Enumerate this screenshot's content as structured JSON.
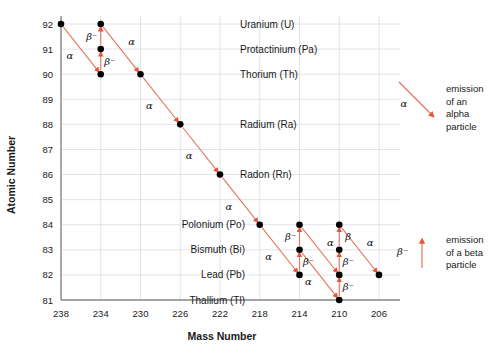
{
  "chart_data": {
    "type": "scatter",
    "title": "",
    "xlabel": "Mass Number",
    "ylabel": "Atomic Number",
    "xticks": [
      238,
      234,
      230,
      226,
      222,
      218,
      214,
      210,
      206
    ],
    "yticks": [
      81,
      82,
      83,
      84,
      85,
      86,
      87,
      88,
      89,
      90,
      91,
      92
    ],
    "xlim": [
      238,
      206
    ],
    "ylim": [
      81,
      92
    ],
    "grid": true,
    "legend_position": "right",
    "accent_color": "#e8553a",
    "nodes": [
      {
        "mass": 238,
        "z": 92,
        "element": "U"
      },
      {
        "mass": 234,
        "z": 90,
        "element": "Th"
      },
      {
        "mass": 234,
        "z": 91,
        "element": "Pa"
      },
      {
        "mass": 234,
        "z": 92,
        "element": "U"
      },
      {
        "mass": 230,
        "z": 90,
        "element": "Th"
      },
      {
        "mass": 226,
        "z": 88,
        "element": "Ra"
      },
      {
        "mass": 222,
        "z": 86,
        "element": "Rn"
      },
      {
        "mass": 218,
        "z": 84,
        "element": "Po"
      },
      {
        "mass": 214,
        "z": 82,
        "element": "Pb"
      },
      {
        "mass": 214,
        "z": 83,
        "element": "Bi"
      },
      {
        "mass": 214,
        "z": 84,
        "element": "Po"
      },
      {
        "mass": 210,
        "z": 81,
        "element": "Tl"
      },
      {
        "mass": 210,
        "z": 82,
        "element": "Pb"
      },
      {
        "mass": 210,
        "z": 83,
        "element": "Bi"
      },
      {
        "mass": 210,
        "z": 84,
        "element": "Po"
      },
      {
        "mass": 206,
        "z": 82,
        "element": "Pb"
      }
    ],
    "decays": [
      {
        "from": [
          238,
          92
        ],
        "to": [
          234,
          90
        ],
        "type": "alpha",
        "label": "α",
        "label_pos": "left"
      },
      {
        "from": [
          234,
          90
        ],
        "to": [
          234,
          91
        ],
        "type": "beta",
        "label": "β⁻",
        "label_pos": "right"
      },
      {
        "from": [
          234,
          91
        ],
        "to": [
          234,
          92
        ],
        "type": "beta",
        "label": "β⁻",
        "label_pos": "left"
      },
      {
        "from": [
          234,
          92
        ],
        "to": [
          230,
          90
        ],
        "type": "alpha",
        "label": "α",
        "label_pos": "right"
      },
      {
        "from": [
          230,
          90
        ],
        "to": [
          226,
          88
        ],
        "type": "alpha",
        "label": "α",
        "label_pos": "left"
      },
      {
        "from": [
          226,
          88
        ],
        "to": [
          222,
          86
        ],
        "type": "alpha",
        "label": "α",
        "label_pos": "left"
      },
      {
        "from": [
          222,
          86
        ],
        "to": [
          218,
          84
        ],
        "type": "alpha",
        "label": "α",
        "label_pos": "left"
      },
      {
        "from": [
          218,
          84
        ],
        "to": [
          214,
          82
        ],
        "type": "alpha",
        "label": "α",
        "label_pos": "left"
      },
      {
        "from": [
          214,
          82
        ],
        "to": [
          214,
          83
        ],
        "type": "beta",
        "label": "β⁻",
        "label_pos": "right"
      },
      {
        "from": [
          214,
          83
        ],
        "to": [
          214,
          84
        ],
        "type": "beta",
        "label": "β⁻",
        "label_pos": "left"
      },
      {
        "from": [
          214,
          84
        ],
        "to": [
          210,
          82
        ],
        "type": "alpha",
        "label": "α",
        "label_pos": "right"
      },
      {
        "from": [
          214,
          83
        ],
        "to": [
          210,
          81
        ],
        "type": "alpha",
        "label": "α",
        "label_pos": "left"
      },
      {
        "from": [
          210,
          81
        ],
        "to": [
          210,
          82
        ],
        "type": "beta",
        "label": "β⁻",
        "label_pos": "right"
      },
      {
        "from": [
          210,
          82
        ],
        "to": [
          210,
          83
        ],
        "type": "beta",
        "label": "β⁻",
        "label_pos": "right"
      },
      {
        "from": [
          210,
          83
        ],
        "to": [
          210,
          84
        ],
        "type": "beta",
        "label": "β",
        "label_pos": "right"
      },
      {
        "from": [
          210,
          84
        ],
        "to": [
          206,
          82
        ],
        "type": "alpha",
        "label": "α",
        "label_pos": "right"
      }
    ],
    "element_labels": [
      {
        "z": 92,
        "text": "Uranium (U)"
      },
      {
        "z": 91,
        "text": "Protactinium (Pa)"
      },
      {
        "z": 90,
        "text": "Thorium (Th)"
      },
      {
        "z": 88,
        "text": "Radium (Ra)"
      },
      {
        "z": 86,
        "text": "Radon (Rn)"
      },
      {
        "z": 84,
        "text": "Polonium (Po)"
      },
      {
        "z": 83,
        "text": "Bismuth (Bi)"
      },
      {
        "z": 82,
        "text": "Lead (Pb)"
      },
      {
        "z": 81,
        "text": "Thallium (Tl)"
      }
    ],
    "legend": [
      {
        "symbol": "α",
        "icon": "alpha-arrow",
        "lines": [
          "emission",
          "of an",
          "alpha",
          "particle"
        ]
      },
      {
        "symbol": "β⁻",
        "icon": "beta-arrow",
        "lines": [
          "emission",
          "of a beta",
          "particle"
        ]
      }
    ]
  }
}
